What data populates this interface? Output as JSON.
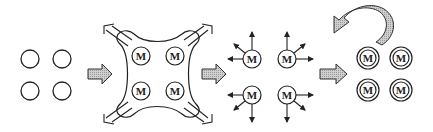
{
  "diagram": {
    "colors": {
      "stroke": "#222222",
      "arrow_fill": "#bdbdbd",
      "background": "#ffffff"
    },
    "stages": [
      {
        "id": "stage-1",
        "description": "four empty circles",
        "items": [
          "",
          "",
          "",
          ""
        ]
      },
      {
        "id": "stage-2",
        "description": "four M circles inside a cross-shaped membrane with outward corner arrows",
        "items": [
          "M",
          "M",
          "M",
          "M"
        ]
      },
      {
        "id": "stage-3",
        "description": "four M circles each emitting three arrows outward",
        "items": [
          "M",
          "M",
          "M",
          "M"
        ]
      },
      {
        "id": "stage-4",
        "description": "four double-ringed M circles with curved return arrow above",
        "items": [
          "M",
          "M",
          "M",
          "M"
        ]
      }
    ],
    "transition_arrows": 3,
    "return_arrow": "curved arrow from stage 4 pointing back left"
  }
}
